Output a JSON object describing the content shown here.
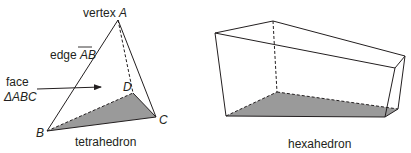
{
  "figures": {
    "tetrahedron": {
      "caption": "tetrahedron",
      "vertex_label_prefix": "vertex ",
      "vertices": {
        "A": "A",
        "B": "B",
        "C": "C",
        "D": "D"
      },
      "edge_label_prefix": "edge ",
      "edge_name": "AB",
      "face_label_line1": "face",
      "face_label_line2": "ΔABC"
    },
    "hexahedron": {
      "caption": "hexahedron"
    }
  },
  "colors": {
    "stroke": "#231f20",
    "shaded_face": "#9a9a9a"
  }
}
